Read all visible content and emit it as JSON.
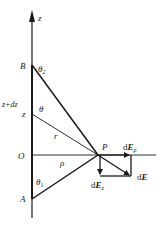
{
  "diagram": {
    "type": "physics-field-of-line-segment",
    "colors": {
      "line": "#1a1a1a",
      "text": "#222222",
      "background": "#ffffff"
    },
    "labels": {
      "axis_z": "z",
      "point_B": "B",
      "theta2_sym": "θ",
      "theta2_sub": "2",
      "z_plus_dz": "z+dz",
      "z": "z",
      "theta": "θ",
      "r": "r",
      "origin": "O",
      "rho": "ρ",
      "theta1_sym": "θ",
      "theta1_sub": "1",
      "point_A": "A",
      "point_P": "P",
      "dE_rho_d": "d",
      "dE_rho_E": "E",
      "dE_rho_sub": "ρ",
      "dE_d": "d",
      "dE_E": "E",
      "dE_z_d": "d",
      "dE_z_E": "E",
      "dE_z_sub": "z"
    },
    "points": {
      "B": [
        32,
        65
      ],
      "A": [
        32,
        199
      ],
      "O": [
        32,
        155
      ],
      "z": [
        32,
        114
      ],
      "z_plus_dz": [
        32,
        104
      ],
      "P": [
        98,
        155
      ]
    }
  }
}
